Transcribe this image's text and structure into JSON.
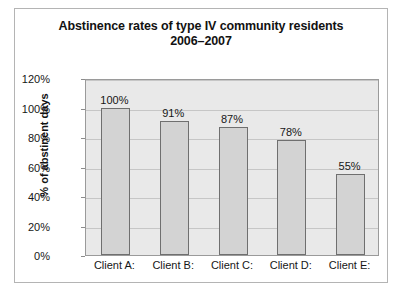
{
  "chart_data": {
    "type": "bar",
    "title": "Abstinence rates of type IV community residents 2006–2007",
    "title_lines": [
      "Abstinence rates of type IV community residents",
      "2006–2007"
    ],
    "categories": [
      "Client A:",
      "Client B:",
      "Client C:",
      "Client D:",
      "Client E:"
    ],
    "values": [
      100,
      91,
      87,
      78,
      55
    ],
    "value_labels": [
      "100%",
      "91%",
      "87%",
      "78%",
      "55%"
    ],
    "xlabel": "",
    "ylabel": "% of abstinent days",
    "ylim": [
      0,
      120
    ],
    "ytick_values": [
      0,
      20,
      40,
      60,
      80,
      100,
      120
    ],
    "ytick_labels": [
      "0%",
      "20%",
      "40%",
      "60%",
      "80%",
      "100%",
      "120%"
    ],
    "grid": true,
    "legend": false,
    "colors": {
      "bar_fill": "#d3d3d3",
      "bar_outline": "#6f6f6f",
      "plot_background": "#e9e9e9",
      "gridline": "#c6c6c6",
      "frame_border": "#b4b4b4",
      "text": "#161616"
    }
  }
}
